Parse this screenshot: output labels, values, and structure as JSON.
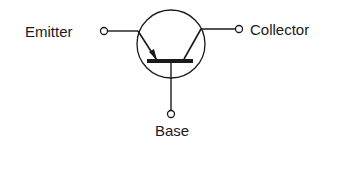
{
  "diagram": {
    "type": "npn-transistor-symbol",
    "labels": {
      "emitter": "Emitter",
      "collector": "Collector",
      "base": "Base"
    },
    "colors": {
      "stroke": "#1a1a1a",
      "background": "#ffffff"
    }
  }
}
